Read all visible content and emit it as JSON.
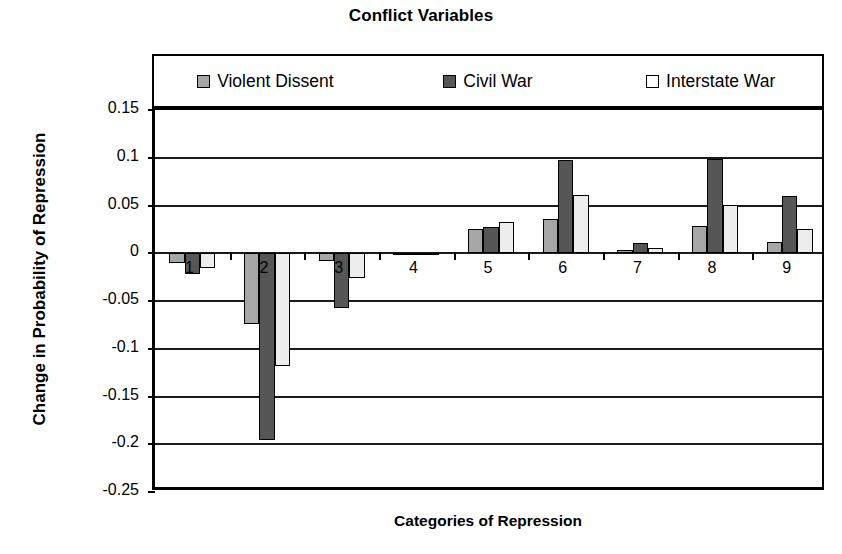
{
  "chart_data": {
    "type": "bar",
    "title": "Conflict Variables",
    "xlabel": "Categories of Repression",
    "ylabel": "Change in Probability of Repression",
    "categories": [
      "1",
      "2",
      "3",
      "4",
      "5",
      "6",
      "7",
      "8",
      "9"
    ],
    "ylim": [
      -0.25,
      0.15
    ],
    "ytick_labels": [
      "0.15",
      "0.1",
      "0.05",
      "0",
      "-0.05",
      "-0.1",
      "-0.15",
      "-0.2",
      "-0.25"
    ],
    "ytick_values": [
      0.15,
      0.1,
      0.05,
      0,
      -0.05,
      -0.1,
      -0.15,
      -0.2,
      -0.25
    ],
    "grid": true,
    "legend_position": "top-inside",
    "series": [
      {
        "name": "Violent Dissent",
        "color": "#a6a6a6",
        "values": [
          -0.01,
          -0.074,
          -0.008,
          0.0,
          0.025,
          0.036,
          0.003,
          0.029,
          0.012
        ]
      },
      {
        "name": "Civil War",
        "color": "#565656",
        "values": [
          -0.022,
          -0.196,
          -0.057,
          -0.002,
          0.027,
          0.098,
          0.011,
          0.099,
          0.06
        ]
      },
      {
        "name": "Interstate War",
        "color": "#ededed",
        "values": [
          -0.015,
          -0.118,
          -0.026,
          0.0,
          0.033,
          0.061,
          0.005,
          0.051,
          0.025
        ]
      }
    ]
  }
}
